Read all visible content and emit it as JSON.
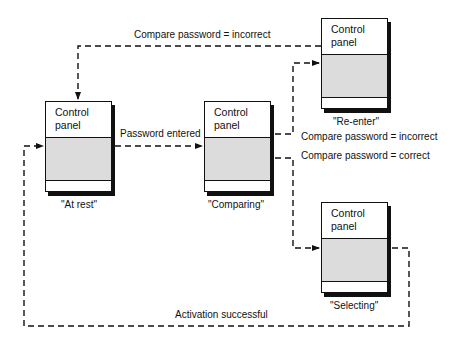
{
  "diagram": {
    "type": "state-transition",
    "colors": {
      "line": "#111111",
      "screen": "#dcdcdc",
      "background": "#ffffff"
    },
    "states": [
      {
        "id": "at_rest",
        "panel_title": "Control panel",
        "caption": "\"At rest\""
      },
      {
        "id": "comparing",
        "panel_title": "Control panel",
        "caption": "\"Comparing\""
      },
      {
        "id": "re_enter",
        "panel_title": "Control panel",
        "caption": "\"Re-enter\""
      },
      {
        "id": "selecting",
        "panel_title": "Control panel",
        "caption": "\"Selecting\""
      }
    ],
    "transitions": [
      {
        "from": "at_rest",
        "to": "comparing",
        "label": "Password entered"
      },
      {
        "from": "comparing",
        "to": "re_enter",
        "label": "Compare password = incorrect"
      },
      {
        "from": "comparing",
        "to": "selecting",
        "label": "Compare password = correct"
      },
      {
        "from": "re_enter",
        "to": "at_rest",
        "label": "Compare password = incorrect"
      },
      {
        "from": "selecting",
        "to": "at_rest",
        "label": "Activation successful"
      }
    ]
  }
}
